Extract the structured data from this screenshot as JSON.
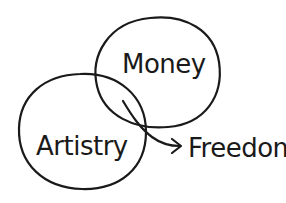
{
  "diagram": {
    "type": "venn",
    "style": "hand-drawn",
    "ink_color": "#1a1a1a",
    "background": "#ffffff",
    "sets": [
      {
        "id": "money",
        "label": "Money"
      },
      {
        "id": "artistry",
        "label": "Artistry"
      }
    ],
    "intersection": {
      "points_to": "Freedom",
      "label": "Freedom"
    }
  }
}
